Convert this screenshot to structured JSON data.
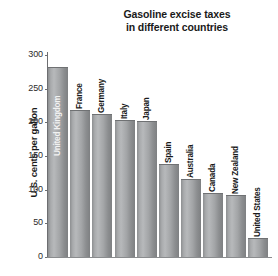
{
  "chart_data": {
    "type": "bar",
    "title": "Gasoline excise taxes in different countries",
    "title_lines": [
      "Gasoline excise taxes",
      "in different countries"
    ],
    "xlabel": "",
    "ylabel": "U.S. cents per gallon",
    "ylim": [
      0,
      300
    ],
    "yticks": [
      0,
      50,
      100,
      150,
      200,
      250,
      300
    ],
    "ytick_labels": [
      "0",
      "50",
      "100",
      "150",
      "200",
      "250",
      "300"
    ],
    "grid": false,
    "legend": "none",
    "bar_color": "#a5a7a9",
    "categories": [
      "United Kingdom",
      "France",
      "Germany",
      "Italy",
      "Japan",
      "Spain",
      "Australia",
      "Canada",
      "New Zealand",
      "United States"
    ],
    "values": [
      281,
      217,
      211,
      202,
      200,
      137,
      114,
      94,
      91,
      27
    ],
    "label_placement": [
      "inside",
      "outside",
      "outside",
      "outside",
      "outside",
      "outside",
      "outside",
      "outside",
      "outside",
      "outside"
    ]
  }
}
